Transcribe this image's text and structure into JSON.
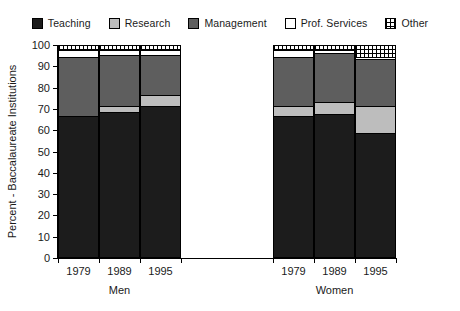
{
  "chart_data": {
    "type": "bar",
    "subtype": "stacked-bar-grouped",
    "title": "",
    "xlabel": "",
    "ylabel": "Percent - Baccalaureate Institutions",
    "ylim": [
      0,
      100
    ],
    "yticks": [
      0,
      10,
      20,
      30,
      40,
      50,
      60,
      70,
      80,
      90,
      100
    ],
    "grid": false,
    "legend_position": "top",
    "legend": [
      {
        "label": "Teaching",
        "swatch": "solid-black",
        "color": "#1c1c1c"
      },
      {
        "label": "Research",
        "swatch": "solid-light-gray",
        "color": "#bdbdbd"
      },
      {
        "label": "Management",
        "swatch": "solid-dark-gray",
        "color": "#5e5e5e"
      },
      {
        "label": "Prof. Services",
        "swatch": "solid-white",
        "color": "#ffffff"
      },
      {
        "label": "Other",
        "swatch": "hatched-dotted",
        "color": "#ffffff"
      }
    ],
    "series": [
      {
        "name": "Teaching",
        "values": [
          66,
          68,
          71,
          66,
          67,
          58
        ]
      },
      {
        "name": "Research",
        "values": [
          0,
          3,
          5,
          5,
          6,
          13
        ]
      },
      {
        "name": "Management",
        "values": [
          28,
          24,
          19,
          23,
          23,
          22
        ]
      },
      {
        "name": "Prof. Services",
        "values": [
          3,
          2,
          2,
          3,
          1,
          1
        ]
      },
      {
        "name": "Other",
        "values": [
          3,
          3,
          3,
          3,
          3,
          6
        ]
      }
    ],
    "groups": [
      {
        "label": "Men",
        "categories": [
          "1979",
          "1989",
          "1995"
        ],
        "bars": [
          {
            "year": "1979",
            "segments": [
              {
                "name": "Teaching",
                "value": 66,
                "y0": 0,
                "y1": 66
              },
              {
                "name": "Research",
                "value": 0,
                "y0": 66,
                "y1": 66
              },
              {
                "name": "Management",
                "value": 28,
                "y0": 66,
                "y1": 94
              },
              {
                "name": "Prof. Services",
                "value": 3,
                "y0": 94,
                "y1": 97
              },
              {
                "name": "Other",
                "value": 3,
                "y0": 97,
                "y1": 100
              }
            ]
          },
          {
            "year": "1989",
            "segments": [
              {
                "name": "Teaching",
                "value": 68,
                "y0": 0,
                "y1": 68
              },
              {
                "name": "Research",
                "value": 3,
                "y0": 68,
                "y1": 71
              },
              {
                "name": "Management",
                "value": 24,
                "y0": 71,
                "y1": 95
              },
              {
                "name": "Prof. Services",
                "value": 2,
                "y0": 95,
                "y1": 97
              },
              {
                "name": "Other",
                "value": 3,
                "y0": 97,
                "y1": 100
              }
            ]
          },
          {
            "year": "1995",
            "segments": [
              {
                "name": "Teaching",
                "value": 71,
                "y0": 0,
                "y1": 71
              },
              {
                "name": "Research",
                "value": 5,
                "y0": 71,
                "y1": 76
              },
              {
                "name": "Management",
                "value": 19,
                "y0": 76,
                "y1": 95
              },
              {
                "name": "Prof. Services",
                "value": 2,
                "y0": 95,
                "y1": 97
              },
              {
                "name": "Other",
                "value": 3,
                "y0": 97,
                "y1": 100
              }
            ]
          }
        ]
      },
      {
        "label": "Women",
        "categories": [
          "1979",
          "1989",
          "1995"
        ],
        "bars": [
          {
            "year": "1979",
            "segments": [
              {
                "name": "Teaching",
                "value": 66,
                "y0": 0,
                "y1": 66
              },
              {
                "name": "Research",
                "value": 5,
                "y0": 66,
                "y1": 71
              },
              {
                "name": "Management",
                "value": 23,
                "y0": 71,
                "y1": 94
              },
              {
                "name": "Prof. Services",
                "value": 3,
                "y0": 94,
                "y1": 97
              },
              {
                "name": "Other",
                "value": 3,
                "y0": 97,
                "y1": 100
              }
            ]
          },
          {
            "year": "1989",
            "segments": [
              {
                "name": "Teaching",
                "value": 67,
                "y0": 0,
                "y1": 67
              },
              {
                "name": "Research",
                "value": 6,
                "y0": 67,
                "y1": 73
              },
              {
                "name": "Management",
                "value": 23,
                "y0": 73,
                "y1": 96
              },
              {
                "name": "Prof. Services",
                "value": 1,
                "y0": 96,
                "y1": 97
              },
              {
                "name": "Other",
                "value": 3,
                "y0": 97,
                "y1": 100
              }
            ]
          },
          {
            "year": "1995",
            "segments": [
              {
                "name": "Teaching",
                "value": 58,
                "y0": 0,
                "y1": 58
              },
              {
                "name": "Research",
                "value": 13,
                "y0": 58,
                "y1": 71
              },
              {
                "name": "Management",
                "value": 22,
                "y0": 71,
                "y1": 93
              },
              {
                "name": "Prof. Services",
                "value": 1,
                "y0": 93,
                "y1": 94
              },
              {
                "name": "Other",
                "value": 6,
                "y0": 94,
                "y1": 100
              }
            ]
          }
        ]
      }
    ]
  }
}
